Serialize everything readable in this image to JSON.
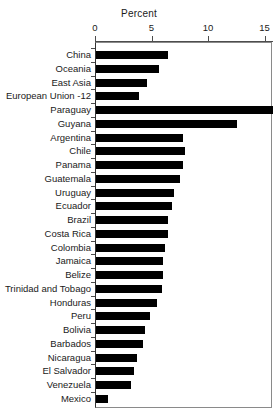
{
  "chart_data": {
    "type": "bar",
    "orientation": "horizontal",
    "title": "Percent",
    "xlabel": "Percent",
    "ylabel": "",
    "xlim": [
      0,
      15.7
    ],
    "xticks": [
      0,
      5,
      10,
      15
    ],
    "xtick_labels": [
      "0",
      "5",
      "10",
      "15"
    ],
    "grid": false,
    "legend": false,
    "bar_color": "#000000",
    "categories": [
      "China",
      "Oceania",
      "East Asia",
      "European Union -12",
      "Paraguay",
      "Guyana",
      "Argentina",
      "Chile",
      "Panama",
      "Guatemala",
      "Uruguay",
      "Ecuador",
      "Brazil",
      "Costa Rica",
      "Colombia",
      "Jamaica",
      "Belize",
      "Trinidad and Tobago",
      "Honduras",
      "Peru",
      "Bolivia",
      "Barbados",
      "Nicaragua",
      "El Salvador",
      "Venezuela",
      "Mexico"
    ],
    "values": [
      6.4,
      5.6,
      4.5,
      3.8,
      15.7,
      12.5,
      7.7,
      7.9,
      7.7,
      7.4,
      6.9,
      6.7,
      6.4,
      6.4,
      6.1,
      5.9,
      5.9,
      5.8,
      5.4,
      4.8,
      4.3,
      4.2,
      3.6,
      3.4,
      3.1,
      1.1
    ]
  }
}
